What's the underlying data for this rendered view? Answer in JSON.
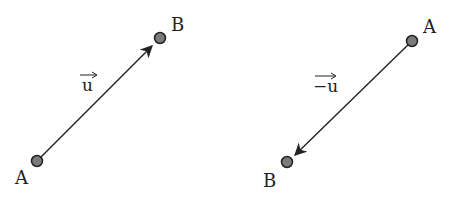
{
  "diagram": {
    "panels": [
      {
        "id": "left",
        "vector_label": "u",
        "point_start": {
          "label": "A",
          "x": 37,
          "y": 161
        },
        "point_end": {
          "label": "B",
          "x": 160,
          "y": 38
        },
        "arrow_direction": "A→B"
      },
      {
        "id": "right",
        "vector_label": "−u",
        "point_start": {
          "label": "B",
          "x": 412,
          "y": 41
        },
        "point_end": {
          "label": "A",
          "x": 287,
          "y": 162
        },
        "arrow_direction": "B→A"
      }
    ],
    "colors": {
      "point_fill": "#7a7a7a",
      "point_stroke": "#222222",
      "line": "#222222"
    }
  }
}
